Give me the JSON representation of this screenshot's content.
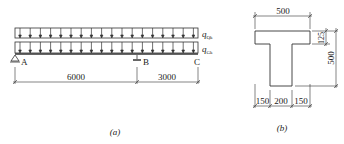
{
  "figure_a": {
    "caption": "(a)",
    "loads": [
      {
        "symbol": "q",
        "subscript": "Qk"
      },
      {
        "symbol": "q",
        "subscript": "Gk"
      }
    ],
    "supports": [
      "A",
      "B",
      "C"
    ],
    "spans": [
      "6000",
      "3000"
    ]
  },
  "figure_b": {
    "caption": "(b)",
    "flange_width": "500",
    "flange_thickness": "125",
    "total_height": "500",
    "bottom_dims": [
      "150",
      "200",
      "150"
    ]
  }
}
